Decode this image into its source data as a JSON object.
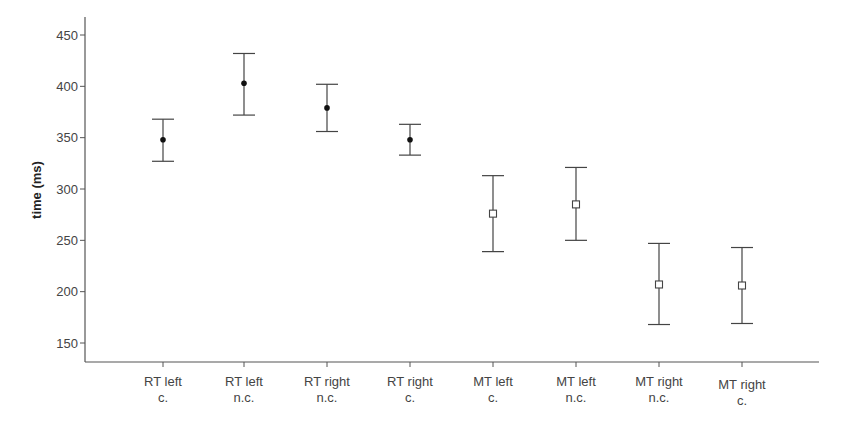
{
  "chart_data": {
    "type": "errorbar",
    "title": "",
    "xlabel": "",
    "ylabel": "time (ms)",
    "ylim": [
      135,
      465
    ],
    "yticks": [
      150,
      200,
      250,
      300,
      350,
      400,
      450
    ],
    "grid": false,
    "legend": null,
    "categories": [
      {
        "line1": "RT left",
        "line2": "c."
      },
      {
        "line1": "RT left",
        "line2": "n.c."
      },
      {
        "line1": "RT right",
        "line2": "n.c."
      },
      {
        "line1": "RT right",
        "line2": "c."
      },
      {
        "line1": "MT left",
        "line2": "c."
      },
      {
        "line1": "MT left",
        "line2": "n.c."
      },
      {
        "line1": "MT right",
        "line2": "n.c."
      },
      {
        "line1": "MT right",
        "line2": "c."
      }
    ],
    "series": [
      {
        "name": "mean",
        "markers": [
          "filled-circle",
          "filled-circle",
          "filled-circle",
          "filled-circle",
          "open-square",
          "open-square",
          "open-square",
          "open-square"
        ],
        "values": [
          348,
          403,
          379,
          348,
          276,
          285,
          207,
          206
        ],
        "upper": [
          368,
          432,
          402,
          363,
          313,
          321,
          247,
          243
        ],
        "lower": [
          327,
          372,
          356,
          333,
          239,
          250,
          168,
          169
        ]
      }
    ]
  },
  "style": {
    "axis_color": "#555555",
    "bar_color": "#444444",
    "marker_color": "#111111"
  }
}
